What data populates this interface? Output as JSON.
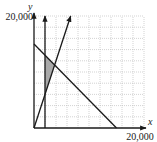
{
  "chart_data": {
    "type": "line",
    "title": "",
    "xlabel": "x",
    "ylabel": "y",
    "xlim": [
      0,
      20000
    ],
    "ylim": [
      0,
      20000
    ],
    "grid": true,
    "grid_step": 2000,
    "x_tick_labels": [
      "20,000"
    ],
    "y_tick_labels": [
      "20,000"
    ],
    "series": [
      {
        "name": "x = 2000",
        "kind": "vertical-ray",
        "points": [
          [
            2000,
            0
          ],
          [
            2000,
            20000
          ]
        ]
      },
      {
        "name": "y = 3x",
        "kind": "ray",
        "points": [
          [
            0,
            0
          ],
          [
            6667,
            20000
          ]
        ]
      },
      {
        "name": "x + y = 15000",
        "kind": "segment",
        "points": [
          [
            0,
            15000
          ],
          [
            15000,
            0
          ]
        ]
      }
    ],
    "shaded_region": {
      "description": "feasible region bounded by x = 2000, y = 3x, and x + y = 15000",
      "vertices": [
        [
          2000,
          6000
        ],
        [
          2000,
          13000
        ],
        [
          3750,
          11250
        ]
      ],
      "fill": "#a9a9a9"
    }
  },
  "colors": {
    "line": "#1a1a1a",
    "grid": "#b5b5b5",
    "shade": "#a9a9a9"
  }
}
